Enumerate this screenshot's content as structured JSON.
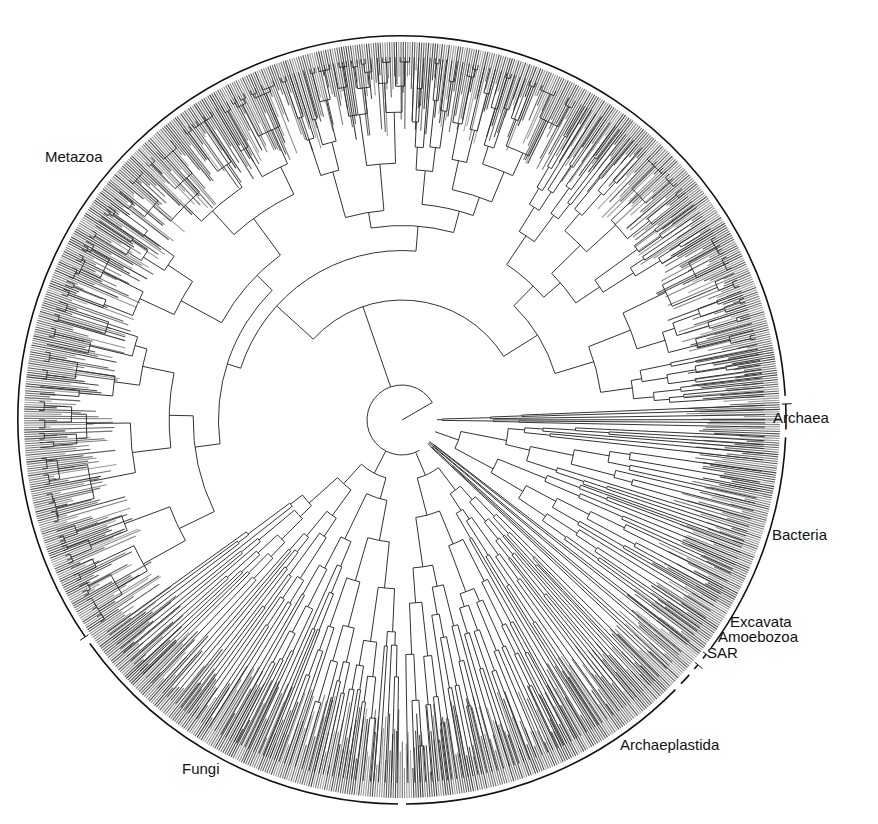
{
  "figure": {
    "type": "circular-phylogenetic-tree",
    "center": [
      402,
      420
    ],
    "outer_ring_radius": 384,
    "tip_radius": 378,
    "line_color": "#333333",
    "tip_shade_color": "#555555",
    "ring_color": "#111111"
  },
  "clades": [
    {
      "name": "Archaea",
      "label": "Archaea",
      "start_deg": -3,
      "end_deg": 2,
      "label_pos": [
        773,
        410
      ],
      "tick": true
    },
    {
      "name": "Bacteria",
      "label": "Bacteria",
      "start_deg": 2,
      "end_deg": 37,
      "label_pos": [
        772,
        527
      ],
      "tick": false
    },
    {
      "name": "Excavata",
      "label": "Excavata",
      "start_deg": 37,
      "end_deg": 39,
      "label_pos": [
        730,
        614
      ],
      "tick": true
    },
    {
      "name": "Amoebozoa",
      "label": "Amoebozoa",
      "start_deg": 39,
      "end_deg": 41,
      "label_pos": [
        718,
        629
      ],
      "tick": true
    },
    {
      "name": "SAR",
      "label": "SAR",
      "start_deg": 41,
      "end_deg": 44,
      "label_pos": [
        707,
        645
      ],
      "tick": false
    },
    {
      "name": "Archaeplastida",
      "label": "Archaeplastida",
      "start_deg": 44,
      "end_deg": 90,
      "label_pos": [
        620,
        737
      ],
      "tick": false
    },
    {
      "name": "Fungi",
      "label": "Fungi",
      "start_deg": 90,
      "end_deg": 145,
      "label_pos": [
        182,
        761
      ],
      "tick": false
    },
    {
      "name": "Metazoa",
      "label": "Metazoa",
      "start_deg": 145,
      "end_deg": 357,
      "label_pos": [
        45,
        149
      ],
      "tick": true
    }
  ],
  "labels": {
    "metazoa": "Metazoa",
    "archaea": "Archaea",
    "bacteria": "Bacteria",
    "excavata": "Excavata",
    "amoebozoa": "Amoebozoa",
    "sar": "SAR",
    "archaeplastida": "Archaeplastida",
    "fungi": "Fungi"
  }
}
